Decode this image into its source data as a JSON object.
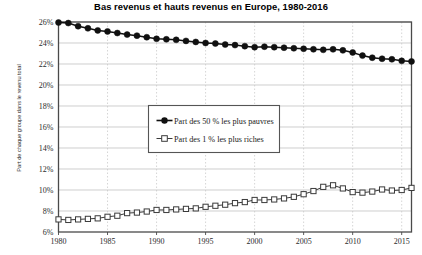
{
  "chart_data": {
    "type": "line",
    "title": "Bas revenus et hauts revenus en Europe, 1980-2016",
    "xlabel": "",
    "ylabel": "Part de chaque groupe dans le revenu total",
    "xlim": [
      1980,
      2016
    ],
    "ylim": [
      6,
      26
    ],
    "ytick_labels": [
      "26%",
      "24%",
      "22%",
      "20%",
      "18%",
      "16%",
      "14%",
      "12%",
      "10%",
      "8%",
      "6%"
    ],
    "ytick_values": [
      26,
      24,
      22,
      20,
      18,
      16,
      14,
      12,
      10,
      8,
      6
    ],
    "xtick_labels": [
      "1980",
      "1985",
      "1990",
      "1995",
      "2000",
      "2005",
      "2010",
      "2015"
    ],
    "xtick_values": [
      1980,
      1985,
      1990,
      1995,
      2000,
      2005,
      2010,
      2015
    ],
    "grid": true,
    "grid_style": "dotted light gray, horizontal and vertical",
    "legend_position": "center-left inside plot",
    "x": [
      1980,
      1981,
      1982,
      1983,
      1984,
      1985,
      1986,
      1987,
      1988,
      1989,
      1990,
      1991,
      1992,
      1993,
      1994,
      1995,
      1996,
      1997,
      1998,
      1999,
      2000,
      2001,
      2002,
      2003,
      2004,
      2005,
      2006,
      2007,
      2008,
      2009,
      2010,
      2011,
      2012,
      2013,
      2014,
      2015,
      2016
    ],
    "series": [
      {
        "name": "Part des 50 % les plus pauvres",
        "marker": "filled-circle",
        "color": "#101010",
        "values": [
          25.95,
          25.9,
          25.6,
          25.4,
          25.2,
          25.1,
          24.95,
          24.8,
          24.7,
          24.55,
          24.4,
          24.35,
          24.3,
          24.2,
          24.1,
          24.0,
          23.95,
          23.85,
          23.8,
          23.7,
          23.6,
          23.65,
          23.6,
          23.55,
          23.5,
          23.45,
          23.4,
          23.35,
          23.4,
          23.3,
          23.1,
          22.8,
          22.6,
          22.5,
          22.45,
          22.3,
          22.25
        ]
      },
      {
        "name": "Part des 1 % les plus riches",
        "marker": "open-square",
        "color": "#3a3a3a",
        "values": [
          7.2,
          7.15,
          7.2,
          7.25,
          7.3,
          7.45,
          7.55,
          7.8,
          7.85,
          7.95,
          8.1,
          8.1,
          8.15,
          8.2,
          8.25,
          8.4,
          8.5,
          8.6,
          8.75,
          8.85,
          9.05,
          9.05,
          9.1,
          9.2,
          9.35,
          9.6,
          9.9,
          10.3,
          10.45,
          10.15,
          9.8,
          9.75,
          9.85,
          10.05,
          9.95,
          10.0,
          10.2
        ]
      }
    ]
  }
}
